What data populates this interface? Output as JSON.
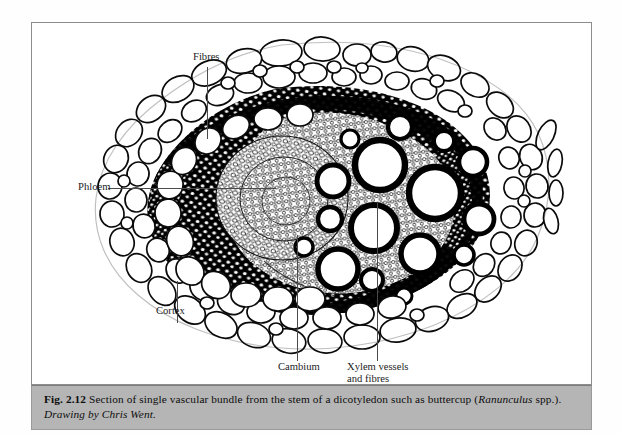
{
  "figure": {
    "frame_border_color": "#8d8d8d",
    "background_color": "#ffffff",
    "illustration_type": "botanical-micrograph-drawing"
  },
  "labels": {
    "fibres": "Fibres",
    "phloem": "Phloem",
    "cortex": "Cortex",
    "cambium": "Cambium",
    "xylem_line1": "Xylem vessels",
    "xylem_line2": "and fibres"
  },
  "caption": {
    "fig_number": "Fig. 2.12",
    "text_before_italic": "Section of single vascular bundle from the stem of a dicotyledon such as buttercup (",
    "italic_genus": "Ranunculus",
    "text_after_italic": " spp.).",
    "credit": "Drawing by Chris Went."
  },
  "colors": {
    "caption_background": "#b5b5b5",
    "ink": "#000000",
    "leader_line": "#4a4a4a",
    "page_background": "#fefefe"
  }
}
